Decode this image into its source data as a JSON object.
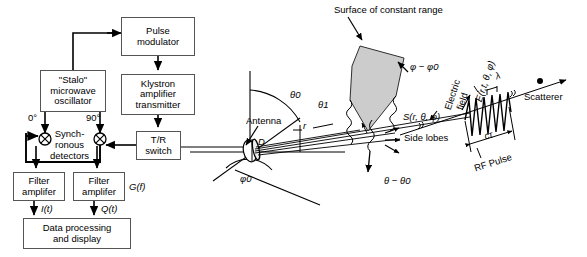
{
  "figure": {
    "background": "#ffffff",
    "line_color": "#000000",
    "box_border": "#555555",
    "surface_fill": "#cccccc"
  },
  "blocks": [
    {
      "id": "pulse-modulator",
      "label": "Pulse\nmodulator",
      "x": 121,
      "y": 17,
      "w": 74,
      "h": 39
    },
    {
      "id": "klystron",
      "label": "Klystron\namplifier\ntransmitter",
      "x": 121,
      "y": 74,
      "w": 74,
      "h": 41
    },
    {
      "id": "stalo",
      "label": "\"Stalo\"\nmicrowave\noscillator",
      "x": 40,
      "y": 70,
      "w": 66,
      "h": 42
    },
    {
      "id": "tr-switch",
      "label": "T/R\nswitch",
      "x": 136,
      "y": 131,
      "w": 45,
      "h": 29
    },
    {
      "id": "filter-amp-i",
      "label": "Filter\namplifer",
      "x": 13,
      "y": 172,
      "w": 52,
      "h": 29
    },
    {
      "id": "filter-amp-q",
      "label": "Filter\namplifer",
      "x": 73,
      "y": 172,
      "w": 52,
      "h": 29
    },
    {
      "id": "data-processing",
      "label": "Data processing\nand display",
      "x": 23,
      "y": 218,
      "w": 108,
      "h": 31
    }
  ],
  "block_text": {
    "pulse_modulator": [
      "Pulse",
      "modulator"
    ],
    "klystron": [
      "Klystron",
      "amplifier",
      "transmitter"
    ],
    "stalo": [
      "\"Stalo\"",
      "microwave",
      "oscillator"
    ],
    "tr_switch": [
      "T/R",
      "switch"
    ],
    "filter_amplifier": [
      "Filter",
      "amplifer"
    ],
    "data_processing": [
      "Data processing",
      "and display"
    ]
  },
  "inline_labels": {
    "phase_0": "0°",
    "phase_90": "90°",
    "synchronous_detectors": [
      "Synch-",
      "ronous",
      "detectors"
    ],
    "transfer_function": "G(f)",
    "i_signal": "I(t)",
    "q_signal": "Q(t)",
    "antenna": "Antenna",
    "theta_0": "θ0",
    "theta_1": "θ1",
    "phi_0": "φ0",
    "range_r": "r",
    "aperture_D": "D",
    "surface_of_constant_range": "Surface of constant range",
    "phi_minus_phi0": "φ − φ0",
    "theta_minus_theta0": "θ − θ0",
    "pattern_function": "S(r, θ, φ)",
    "electric_field": [
      "Electric",
      "field"
    ],
    "field_expression": "E(r,t, θ, φ)",
    "wavelength": "λ",
    "pulse_length": "cτ",
    "rf_pulse": "RF Pulse",
    "side_lobes": "Side lobes",
    "scatterer": "Scatterer"
  },
  "connections": [
    {
      "name": "stalo-to-pulse-modulator"
    },
    {
      "name": "pulse-modulator-to-klystron"
    },
    {
      "name": "klystron-to-tr-switch"
    },
    {
      "name": "tr-switch-to-mixer-q"
    },
    {
      "name": "stalo-to-mixer-i-0deg"
    },
    {
      "name": "stalo-to-mixer-q-90deg"
    },
    {
      "name": "mixer-i-to-filter-i"
    },
    {
      "name": "mixer-q-to-filter-q"
    },
    {
      "name": "filter-i-to-data-processing"
    },
    {
      "name": "filter-q-to-data-processing"
    },
    {
      "name": "tr-switch-to-antenna"
    }
  ]
}
